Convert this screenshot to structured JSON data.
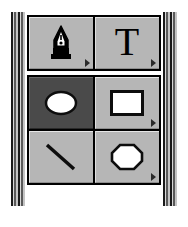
{
  "palette": {
    "name": "Tools",
    "accent_selected_bg": "#4a4a4a",
    "button_face": "#b6b6b6",
    "frame_color": "#000000",
    "groups": [
      {
        "name": "drawing-tools",
        "rows": [
          {
            "tools": [
              {
                "id": "pen",
                "label": "Pen",
                "icon": "pen-nib-icon",
                "selected": false,
                "has_more": true
              },
              {
                "id": "text",
                "label": "Text",
                "icon": "text-t-icon",
                "glyph": "T",
                "selected": false,
                "has_more": true
              }
            ]
          }
        ]
      },
      {
        "name": "shape-tools",
        "rows": [
          {
            "tools": [
              {
                "id": "ellipse",
                "label": "Ellipse",
                "icon": "ellipse-icon",
                "selected": true,
                "has_more": false
              },
              {
                "id": "rectangle",
                "label": "Rectangle",
                "icon": "rectangle-icon",
                "selected": false,
                "has_more": true
              }
            ]
          },
          {
            "tools": [
              {
                "id": "line",
                "label": "Line",
                "icon": "line-icon",
                "selected": false,
                "has_more": false
              },
              {
                "id": "polygon",
                "label": "Polygon",
                "icon": "polygon-icon",
                "selected": false,
                "has_more": true
              }
            ]
          }
        ]
      }
    ]
  }
}
